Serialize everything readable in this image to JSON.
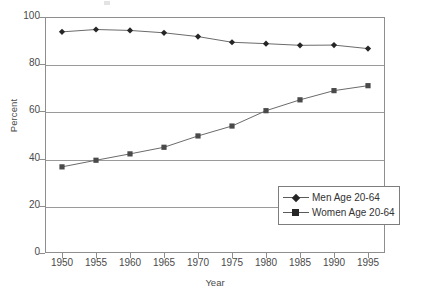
{
  "chart_data": {
    "type": "line",
    "title": "",
    "xlabel": "Year",
    "ylabel": "Percent",
    "categories": [
      1950,
      1955,
      1960,
      1965,
      1970,
      1975,
      1980,
      1985,
      1990,
      1995
    ],
    "xlim": [
      1947.5,
      1997.5
    ],
    "ylim": [
      0,
      100
    ],
    "xticks": [
      "1950",
      "1955",
      "1960",
      "1965",
      "1970",
      "1975",
      "1980",
      "1985",
      "1990",
      "1995"
    ],
    "yticks": [
      "0",
      "20",
      "40",
      "60",
      "80",
      "100"
    ],
    "grid": "horizontal",
    "legend_position": "lower-right",
    "series": [
      {
        "name": "Men Age 20-64",
        "marker": "diamond",
        "color": "#262626",
        "values": [
          93.7,
          94.7,
          94.3,
          93.3,
          91.7,
          89.3,
          88.7,
          88.0,
          88.1,
          86.6
        ]
      },
      {
        "name": "Women Age 20-64",
        "marker": "square",
        "color": "#4a4a4a",
        "values": [
          36.5,
          39.3,
          42.0,
          44.8,
          49.6,
          53.8,
          60.3,
          64.9,
          68.8,
          70.9
        ]
      }
    ]
  },
  "axes": {
    "ylabel": "Percent",
    "xlabel": "Year",
    "ytick_labels": [
      "100",
      "80",
      "60",
      "40",
      "20",
      "0"
    ],
    "xtick_labels": [
      "1950",
      "1955",
      "1960",
      "1965",
      "1970",
      "1975",
      "1980",
      "1985",
      "1990",
      "1995"
    ]
  },
  "legend": {
    "entries": [
      {
        "label": "Men Age 20-64",
        "marker": "diamond-marker"
      },
      {
        "label": "Women Age 20-64",
        "marker": "square-marker"
      }
    ]
  },
  "style": {
    "frame_color": "#8e8e8e",
    "grid_color": "#9a9a9a",
    "text_color": "#4a4a4a",
    "series_men_color": "#262626",
    "series_women_color": "#4a4a4a",
    "background": "#ffffff"
  }
}
